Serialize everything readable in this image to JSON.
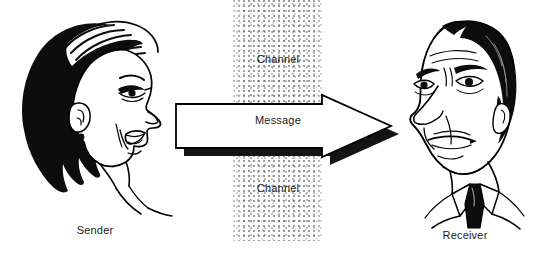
{
  "diagram": {
    "background_color": "#ffffff",
    "ink_color": "#000000"
  },
  "channel": {
    "top_label": "Channel",
    "bottom_label": "Channel",
    "band_color": "#7a7a7a",
    "band_style": "stippled"
  },
  "message": {
    "label": "Message",
    "arrow_direction": "right",
    "arrow_fill": "#ffffff",
    "arrow_outline": "#000000",
    "arrow_shadow": "#1a1a1a"
  },
  "sender": {
    "label": "Sender",
    "icon": "woman-profile-speaking-icon",
    "facing": "right",
    "hair_color": "#111111",
    "skin_color": "#ffffff"
  },
  "receiver": {
    "label": "Receiver",
    "icon": "man-head-listening-icon",
    "facing": "left",
    "hair_color": "#111111",
    "tie_color": "#111111",
    "skin_color": "#ffffff"
  }
}
